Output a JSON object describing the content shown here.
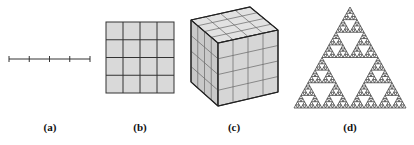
{
  "figure": {
    "panels": [
      {
        "id": "a",
        "label": "(a)",
        "description": "line segment divided into 4 equal parts",
        "label_x": 50
      },
      {
        "id": "b",
        "label": "(b)",
        "description": "square divided into 4x4 grid",
        "label_x": 140
      },
      {
        "id": "c",
        "label": "(c)",
        "description": "cube divided into 4x4x4 sub-cubes",
        "label_x": 234
      },
      {
        "id": "d",
        "label": "(d)",
        "description": "Sierpinski triangle fractal",
        "label_x": 350
      }
    ],
    "colors": {
      "stroke": "#333333",
      "fill_light": "#d9d9d9",
      "fill_top": "#e2e2e2",
      "fill_side": "#c9c9c9",
      "fill_front": "#d6d6d6",
      "fractal": "#444444"
    },
    "line": {
      "x1": 9,
      "x2": 90,
      "y": 59,
      "divisions": 4
    },
    "grid": {
      "x": 106,
      "y": 22,
      "w": 68,
      "h": 71,
      "divisions": 4
    },
    "cube": {
      "divisions": 4
    },
    "sierpinski": {
      "apex": [
        350,
        7
      ],
      "left": [
        294,
        108
      ],
      "right": [
        406,
        108
      ],
      "depth": 5
    }
  }
}
